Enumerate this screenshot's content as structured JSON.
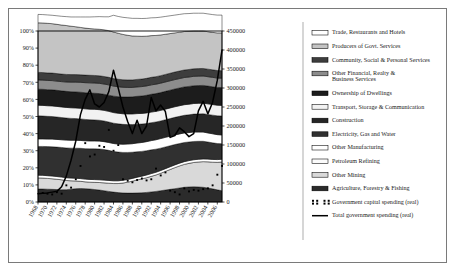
{
  "chart_data": {
    "type": "area",
    "title": "",
    "subtitle": "",
    "xlabel": "",
    "ylabel": "",
    "y2label": "",
    "grid": false,
    "legend_position": "right",
    "x": [
      1968,
      1969,
      1970,
      1971,
      1972,
      1973,
      1974,
      1975,
      1976,
      1977,
      1978,
      1979,
      1980,
      1981,
      1982,
      1983,
      1984,
      1985,
      1986,
      1987,
      1988,
      1989,
      1990,
      1991,
      1992,
      1993,
      1994,
      1995,
      1996,
      1997,
      1998,
      1999,
      2000,
      2001,
      2002,
      2003,
      2004,
      2005,
      2006,
      2007
    ],
    "xtick_labels": [
      "1968",
      "1970",
      "1972",
      "1974",
      "1976",
      "1978",
      "1980",
      "1982",
      "1984",
      "1986",
      "1988",
      "1990",
      "1992",
      "1994",
      "1996",
      "1998",
      "2000",
      "2002",
      "2004",
      "2006"
    ],
    "ylim": [
      0,
      100
    ],
    "ytick_labels": [
      "0%",
      "10%",
      "20%",
      "30%",
      "40%",
      "50%",
      "60%",
      "70%",
      "80%",
      "90%",
      "100%"
    ],
    "ytick_values": [
      0,
      10,
      20,
      30,
      40,
      50,
      60,
      70,
      80,
      90,
      100
    ],
    "y2lim": [
      0,
      450000
    ],
    "y2tick_labels": [
      "0",
      "50000",
      "100000",
      "150000",
      "200000",
      "250000",
      "300000",
      "350000",
      "400000",
      "450000"
    ],
    "y2tick_values": [
      0,
      50000,
      100000,
      150000,
      200000,
      250000,
      300000,
      350000,
      400000,
      450000
    ],
    "stack_order_bottom_to_top": [
      "Agriculture, Forestry & Fishing",
      "Other Mining",
      "Petroleum Refining",
      "Other Manufacturing",
      "Electricity, Gas and Water",
      "Construction",
      "Transport, Storage & Communication",
      "Ownership of Dwellings",
      "Other Financial, Realty & Business Services",
      "Community, Social & Personal Services",
      "Producers of Govt. Services",
      "Trade, Restaurants and Hotels"
    ],
    "series": [
      {
        "name": "Agriculture, Forestry & Fishing",
        "color": "#2b2b2b",
        "values": [
          7.6,
          7.6,
          7.5,
          7.4,
          7.3,
          7.2,
          7.2,
          7.5,
          7.8,
          7.9,
          7.8,
          7.6,
          7.3,
          7.0,
          6.6,
          6.2,
          5.8,
          5.5,
          5.3,
          5.2,
          5.2,
          5.3,
          5.4,
          5.6,
          5.9,
          6.2,
          6.6,
          7.0,
          7.4,
          7.8,
          8.2,
          8.6,
          8.8,
          8.9,
          8.8,
          8.6,
          8.2,
          7.7,
          7.1,
          6.6
        ]
      },
      {
        "name": "Other Mining",
        "color": "#d9d9d9",
        "values": [
          6.5,
          6.4,
          6.3,
          6.2,
          6.0,
          5.8,
          5.4,
          4.9,
          4.5,
          4.2,
          4.0,
          4.0,
          4.2,
          4.4,
          4.6,
          4.8,
          5.0,
          5.3,
          5.8,
          6.4,
          7.0,
          7.6,
          8.1,
          8.6,
          9.1,
          9.6,
          10.2,
          10.9,
          11.6,
          12.3,
          12.9,
          13.4,
          13.8,
          14.2,
          14.6,
          15.0,
          15.3,
          15.6,
          16.1,
          16.8
        ]
      },
      {
        "name": "Petroleum Refining",
        "color": "#ffffff",
        "values": [
          1.6,
          1.6,
          1.6,
          1.6,
          1.6,
          1.6,
          1.6,
          1.6,
          1.6,
          1.6,
          1.6,
          1.6,
          1.6,
          1.6,
          1.6,
          1.6,
          1.6,
          1.6,
          1.6,
          1.6,
          1.6,
          1.6,
          1.6,
          1.6,
          1.6,
          1.6,
          1.6,
          1.6,
          1.6,
          1.6,
          1.6,
          1.6,
          1.6,
          1.6,
          1.6,
          1.6,
          1.6,
          1.6,
          1.6,
          1.6
        ]
      },
      {
        "name": "Other Manufacturing",
        "color": "#303030",
        "values": [
          16.8,
          16.9,
          17.0,
          17.1,
          17.2,
          17.3,
          17.4,
          17.5,
          17.6,
          17.7,
          17.8,
          17.9,
          18.0,
          18.0,
          17.9,
          17.6,
          17.2,
          16.8,
          16.3,
          15.8,
          15.3,
          14.9,
          14.5,
          14.2,
          13.9,
          13.5,
          13.1,
          12.7,
          12.3,
          11.9,
          11.5,
          11.2,
          10.9,
          10.7,
          10.5,
          10.3,
          10.0,
          9.7,
          9.4,
          9.1
        ]
      },
      {
        "name": "Electricity, Gas and Water",
        "color": "#ffffff",
        "values": [
          4.4,
          4.4,
          4.4,
          4.5,
          4.5,
          4.5,
          4.6,
          4.6,
          4.6,
          4.6,
          4.6,
          4.6,
          4.6,
          4.6,
          4.6,
          4.6,
          4.6,
          4.7,
          4.8,
          4.9,
          5.0,
          5.1,
          5.2,
          5.3,
          5.4,
          5.5,
          5.6,
          5.6,
          5.6,
          5.6,
          5.6,
          5.6,
          5.5,
          5.5,
          5.4,
          5.4,
          5.3,
          5.3,
          5.2,
          5.1
        ]
      },
      {
        "name": "Construction",
        "color": "#262626",
        "values": [
          13.5,
          13.4,
          13.3,
          13.2,
          13.1,
          13.0,
          12.9,
          12.8,
          12.7,
          12.6,
          12.5,
          12.4,
          12.3,
          12.2,
          12.1,
          12.0,
          11.9,
          11.8,
          11.6,
          11.4,
          11.2,
          11.0,
          10.8,
          10.6,
          10.5,
          10.4,
          10.3,
          10.3,
          10.3,
          10.3,
          10.3,
          10.3,
          10.4,
          10.5,
          10.6,
          10.7,
          10.8,
          10.9,
          11.0,
          11.1
        ]
      },
      {
        "name": "Transport, Storage & Communication",
        "color": "#f2f2f2",
        "values": [
          6.2,
          6.2,
          6.2,
          6.2,
          6.2,
          6.2,
          6.2,
          6.2,
          6.2,
          6.2,
          6.2,
          6.2,
          6.2,
          6.2,
          6.2,
          6.2,
          6.2,
          6.2,
          6.2,
          6.2,
          6.2,
          6.2,
          6.2,
          6.2,
          6.2,
          6.2,
          6.2,
          6.2,
          6.2,
          6.2,
          6.2,
          6.2,
          6.2,
          6.2,
          6.2,
          6.2,
          6.2,
          6.2,
          6.2,
          6.2
        ]
      },
      {
        "name": "Ownership of Dwellings",
        "color": "#1c1c1c",
        "values": [
          9.4,
          9.4,
          9.4,
          9.4,
          9.4,
          9.4,
          9.4,
          9.4,
          9.4,
          9.4,
          9.4,
          9.4,
          9.4,
          9.4,
          9.4,
          9.5,
          9.6,
          9.7,
          9.8,
          9.9,
          10.0,
          10.1,
          10.2,
          10.3,
          10.4,
          10.4,
          10.4,
          10.4,
          10.4,
          10.4,
          10.4,
          10.4,
          10.4,
          10.4,
          10.4,
          10.4,
          10.4,
          10.4,
          10.4,
          10.4
        ]
      },
      {
        "name": "Other Financial, Realty & Business Services",
        "color": "#8c8c8c",
        "values": [
          5.4,
          5.4,
          5.4,
          5.4,
          5.4,
          5.4,
          5.5,
          5.6,
          5.7,
          5.8,
          5.9,
          6.0,
          6.0,
          6.0,
          6.0,
          6.0,
          5.9,
          5.8,
          5.7,
          5.6,
          5.5,
          5.5,
          5.5,
          5.5,
          5.5,
          5.5,
          5.5,
          5.5,
          5.5,
          5.5,
          5.5,
          5.5,
          5.5,
          5.5,
          5.5,
          5.5,
          5.5,
          5.5,
          5.5,
          5.5
        ]
      },
      {
        "name": "Community, Social & Personal Services",
        "color": "#3d3d3d",
        "values": [
          4.4,
          4.4,
          4.4,
          4.4,
          4.4,
          4.4,
          4.4,
          4.4,
          4.4,
          4.4,
          4.4,
          4.4,
          4.4,
          4.4,
          4.4,
          4.4,
          4.4,
          4.4,
          4.4,
          4.4,
          4.4,
          4.4,
          4.4,
          4.4,
          4.4,
          4.4,
          4.4,
          4.4,
          4.4,
          4.4,
          4.4,
          4.4,
          4.4,
          4.4,
          4.4,
          4.4,
          4.4,
          4.4,
          4.4,
          4.4
        ]
      },
      {
        "name": "Producers of Govt. Services",
        "color": "#c4c4c4",
        "values": [
          29.0,
          29.0,
          29.0,
          28.9,
          28.8,
          28.7,
          28.6,
          28.3,
          28.0,
          27.7,
          27.5,
          27.3,
          27.2,
          27.2,
          27.3,
          27.3,
          27.2,
          26.9,
          26.5,
          26.1,
          25.7,
          25.3,
          25.0,
          24.7,
          24.4,
          24.1,
          23.8,
          23.5,
          23.2,
          22.9,
          22.7,
          22.5,
          22.3,
          22.1,
          22.0,
          21.9,
          21.9,
          21.9,
          22.0,
          22.1
        ]
      },
      {
        "name": "Trade, Restaurants and Hotels",
        "color": "#ffffff",
        "values": [
          4.9,
          4.9,
          4.9,
          4.9,
          5.0,
          5.1,
          5.2,
          5.4,
          5.7,
          6.1,
          6.5,
          6.8,
          7.1,
          7.4,
          7.6,
          8.1,
          9.8,
          9.8,
          10.0,
          10.2,
          10.3,
          10.4,
          10.4,
          10.4,
          10.4,
          10.4,
          10.4,
          10.4,
          10.4,
          10.4,
          10.4,
          10.4,
          10.4,
          10.4,
          10.4,
          10.4,
          10.4,
          10.4,
          10.4,
          10.4
        ]
      }
    ],
    "lines": [
      {
        "name": "Total government spending (real)",
        "color": "#000000",
        "axis": "y2",
        "points": [
          [
            1968,
            22000
          ],
          [
            1969,
            23000
          ],
          [
            1970,
            24000
          ],
          [
            1971,
            26000
          ],
          [
            1972,
            28000
          ],
          [
            1973,
            40000
          ],
          [
            1974,
            68000
          ],
          [
            1975,
            110000
          ],
          [
            1976,
            160000
          ],
          [
            1977,
            230000
          ],
          [
            1978,
            270000
          ],
          [
            1979,
            295000
          ],
          [
            1980,
            258000
          ],
          [
            1981,
            250000
          ],
          [
            1982,
            262000
          ],
          [
            1983,
            290000
          ],
          [
            1984,
            347000
          ],
          [
            1985,
            300000
          ],
          [
            1986,
            250000
          ],
          [
            1987,
            212000
          ],
          [
            1988,
            180000
          ],
          [
            1989,
            215000
          ],
          [
            1990,
            180000
          ],
          [
            1991,
            200000
          ],
          [
            1992,
            275000
          ],
          [
            1993,
            240000
          ],
          [
            1994,
            255000
          ],
          [
            1995,
            238000
          ],
          [
            1996,
            170000
          ],
          [
            1997,
            175000
          ],
          [
            1998,
            195000
          ],
          [
            1999,
            185000
          ],
          [
            2000,
            172000
          ],
          [
            2001,
            180000
          ],
          [
            2002,
            240000
          ],
          [
            2003,
            265000
          ],
          [
            2004,
            232000
          ],
          [
            2005,
            262000
          ],
          [
            2006,
            320000
          ],
          [
            2007,
            400000
          ]
        ]
      }
    ],
    "scatter": [
      {
        "name": "Government capital spending (real)",
        "color": "#000000",
        "axis": "y2",
        "marker": "square",
        "points": [
          [
            1969,
            24000
          ],
          [
            1970,
            22000
          ],
          [
            1971,
            20000
          ],
          [
            1972,
            26000
          ],
          [
            1973,
            22000
          ],
          [
            1974,
            44000
          ],
          [
            1975,
            38000
          ],
          [
            1976,
            60000
          ],
          [
            1977,
            95000
          ],
          [
            1978,
            155000
          ],
          [
            1979,
            120000
          ],
          [
            1980,
            125000
          ],
          [
            1981,
            148000
          ],
          [
            1982,
            145000
          ],
          [
            1983,
            190000
          ],
          [
            1984,
            135000
          ],
          [
            1985,
            150000
          ],
          [
            1986,
            60000
          ],
          [
            1987,
            56000
          ],
          [
            1988,
            52000
          ],
          [
            1989,
            58000
          ],
          [
            1990,
            62000
          ],
          [
            1991,
            57000
          ],
          [
            1992,
            60000
          ],
          [
            1993,
            88000
          ],
          [
            1994,
            70000
          ],
          [
            1995,
            78000
          ],
          [
            1996,
            30000
          ],
          [
            1997,
            26000
          ],
          [
            1998,
            20000
          ],
          [
            1999,
            36000
          ],
          [
            2000,
            28000
          ],
          [
            2001,
            32000
          ],
          [
            2002,
            30000
          ],
          [
            2003,
            34000
          ],
          [
            2004,
            36000
          ],
          [
            2005,
            44000
          ],
          [
            2006,
            72000
          ],
          [
            2007,
            95000
          ]
        ]
      }
    ]
  },
  "legend": {
    "items": [
      {
        "label": "Trade, Restaurants and Hotels",
        "swatch": "#ffffff",
        "type": "patch"
      },
      {
        "label": "Producers of Govt. Services",
        "swatch": "#c4c4c4",
        "type": "patch"
      },
      {
        "label": "Community, Social & Personal Services",
        "swatch": "#3d3d3d",
        "type": "patch"
      },
      {
        "label": "Other Financial, Realty &",
        "label2": "Business Services",
        "swatch": "#8c8c8c",
        "type": "patch"
      },
      {
        "label": "Ownership of Dwellings",
        "swatch": "#1c1c1c",
        "type": "patch"
      },
      {
        "label": "Transport, Storage & Communication",
        "swatch": "#f2f2f2",
        "type": "patch"
      },
      {
        "label": "Construction",
        "swatch": "#262626",
        "type": "patch"
      },
      {
        "label": "Electricity, Gas and Water",
        "swatch": "#303030",
        "type": "patch"
      },
      {
        "label": "Other Manufacturing",
        "swatch": "#ffffff",
        "type": "patch"
      },
      {
        "label": "Petroleum Refining",
        "swatch": "#fbfbfb",
        "type": "patch"
      },
      {
        "label": "Other Mining",
        "swatch": "#d9d9d9",
        "type": "patch"
      },
      {
        "label": "Agriculture, Forestry & Fishing",
        "swatch": "#2b2b2b",
        "type": "patch"
      },
      {
        "label": "Government capital spending (real)",
        "swatch": "#000000",
        "type": "marker"
      },
      {
        "label": "Total government spending (real)",
        "swatch": "#000000",
        "type": "line"
      }
    ]
  }
}
